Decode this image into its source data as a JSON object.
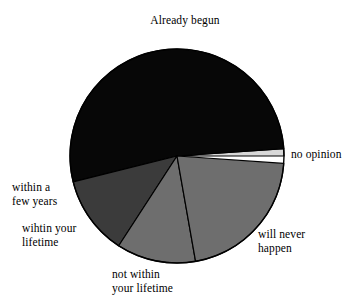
{
  "chart_data": {
    "type": "pie",
    "title": "",
    "xlabel": "",
    "ylabel": "",
    "legend_position": "none",
    "grid": false,
    "labels_placement": "outside-callout",
    "center": [
      177,
      156
    ],
    "radius": 107,
    "start_angle_deg": 0,
    "direction": "counterclockwise",
    "categories": [
      "no opinion",
      "Already begun",
      "wihtin your lifetime",
      "not within your lifetime",
      "will never happen"
    ],
    "values": [
      1,
      53,
      12,
      12,
      22
    ],
    "slices": [
      {
        "label": "no opinion",
        "label_lines": [
          "no opinion"
        ],
        "value": 1,
        "start_deg": 0,
        "end_deg": 4,
        "color": "#d8d8d8"
      },
      {
        "label": "Already begun",
        "label_lines": [
          "Already begun"
        ],
        "value": 53,
        "start_deg": 4,
        "end_deg": 194,
        "color": "#070707"
      },
      {
        "label": "wihtin your lifetime",
        "label_lines": [
          "wihtin your",
          "lifetime"
        ],
        "value": 12,
        "start_deg": 194,
        "end_deg": 237,
        "color": "#3b3b3b"
      },
      {
        "label": "not within your lifetime",
        "label_lines": [
          "not within",
          "your lifetime"
        ],
        "value": 12,
        "start_deg": 237,
        "end_deg": 280,
        "color": "#6e6e6e"
      },
      {
        "label": "will never happen",
        "label_lines": [
          "will never",
          "happen"
        ],
        "value": 22,
        "start_deg": 280,
        "end_deg": 356,
        "color": "#6e6e6e"
      }
    ]
  },
  "labels": {
    "already_begun": "Already begun",
    "no_opinion": "no opinion",
    "will_never_happen": "will never\nhappen",
    "not_within_your_lifetime": "not within\nyour lifetime",
    "within_a_few_years": "within a\nfew years",
    "wihtin_your_lifetime": "wihtin your\nlifetime"
  },
  "colors": {
    "background": "#ffffff",
    "outline": "#000000",
    "already_begun": "#070707",
    "within_your_lifetime": "#3b3b3b",
    "not_within_your_lifetime": "#6e6e6e",
    "will_never_happen": "#6e6e6e",
    "no_opinion": "#d8d8d8"
  }
}
